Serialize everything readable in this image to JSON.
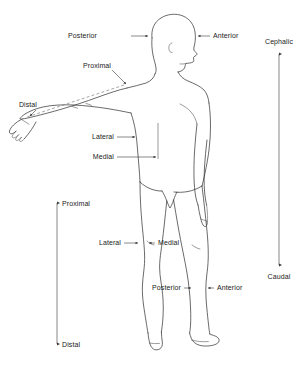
{
  "diagram": {
    "background_color": "#ffffff",
    "line_color": "#2b2b2b",
    "text_color": "#222222"
  },
  "labels": {
    "head_posterior": "Posterior",
    "head_anterior": "Anterior",
    "arm_proximal": "Proximal",
    "arm_distal": "Distal",
    "torso_lateral": "Lateral",
    "torso_medial": "Medial",
    "leg_axis_proximal": "Proximal",
    "leg_axis_distal": "Distal",
    "leg_lateral": "Lateral",
    "leg_medial": "Medial",
    "leg_posterior": "Posterior",
    "leg_anterior": "Anterior",
    "body_cephalic": "Cephalic",
    "body_caudal": "Caudal"
  },
  "axes": [
    {
      "name": "cephalic-caudal-axis",
      "top_label": "Cephalic",
      "bottom_label": "Caudal",
      "orientation": "vertical",
      "double_headed": true
    },
    {
      "name": "proximal-distal-leg-axis",
      "top_label": "Proximal",
      "bottom_label": "Distal",
      "orientation": "vertical",
      "double_headed": true
    },
    {
      "name": "proximal-distal-arm-axis",
      "top_label": "Proximal",
      "bottom_label": "Distal",
      "orientation": "diagonal",
      "double_headed": false
    }
  ]
}
